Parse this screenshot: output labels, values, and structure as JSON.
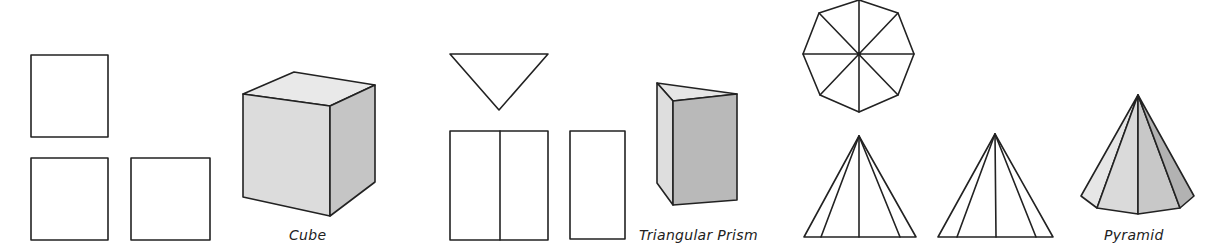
{
  "figure": {
    "groups": [
      {
        "id": "cube",
        "label": "Cube",
        "views": [
          "front-view-square",
          "side-view-square",
          "top-view-square"
        ],
        "shading": {
          "top": "#e9e9e9",
          "front": "#dcdcdc",
          "right": "#c5c5c5"
        }
      },
      {
        "id": "triangular-prism",
        "label": "Triangular Prism",
        "views": [
          "top-view-triangle",
          "front-view-rectangle-divided",
          "side-view-rectangle"
        ],
        "shading": {
          "top": "#e6e6e6",
          "left": "#dedede",
          "front": "#b9b9b9"
        }
      },
      {
        "id": "pyramid",
        "label": "Pyramid",
        "views": [
          "top-view-octagon",
          "front-view-triangle",
          "side-view-triangle"
        ],
        "shading": {
          "face1": "#e6e6e6",
          "face2": "#dadada",
          "face3": "#cccccc",
          "face4": "#bcbcbc",
          "face5": "#a9a9a9"
        }
      }
    ],
    "colors": {
      "line": "#222222",
      "background": "#ffffff"
    }
  }
}
